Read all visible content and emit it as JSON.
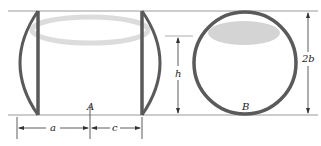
{
  "diagram": {
    "labels": {
      "container_a": "A",
      "container_b": "B",
      "dim_a": "a",
      "dim_c": "c",
      "dim_h": "h",
      "dim_2b": "2b"
    },
    "colors": {
      "outline": "#5a5a5a",
      "guide_line": "#9a9a9a",
      "liquid": "#d4d4d4",
      "dimension": "#333333"
    }
  }
}
